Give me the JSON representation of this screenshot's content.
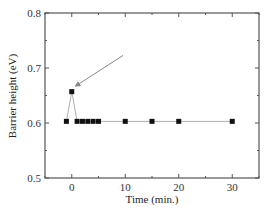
{
  "chart_data": {
    "type": "scatter",
    "title": "",
    "xlabel": "Time (min.)",
    "ylabel": "Barrier height (eV)",
    "xlim": [
      -5,
      35
    ],
    "ylim": [
      0.5,
      0.8
    ],
    "xticks": [
      0,
      10,
      20,
      30
    ],
    "xtick_labels": [
      "0",
      "10",
      "20",
      "30"
    ],
    "yticks": [
      0.5,
      0.6,
      0.7,
      0.8
    ],
    "ytick_labels": [
      "0.5",
      "0.6",
      "0.7",
      "0.8"
    ],
    "grid": false,
    "legend": null,
    "series": [
      {
        "name": "Barrier height",
        "marker": "square",
        "line": "thin gray connecting line",
        "x": [
          -1,
          0,
          1,
          2,
          3,
          4,
          5,
          10,
          15,
          20,
          30
        ],
        "y": [
          0.603,
          0.657,
          0.603,
          0.603,
          0.603,
          0.603,
          0.603,
          0.603,
          0.603,
          0.603,
          0.603
        ]
      }
    ],
    "annotations": [
      {
        "type": "arrow",
        "from": [
          9.6,
          0.723
        ],
        "to": [
          0.7,
          0.667
        ],
        "note": "arrow pointing at peak point (0, 0.657)"
      }
    ]
  },
  "colors": {
    "axis": "#555555",
    "marker": "#111111",
    "line": "#999999",
    "arrow": "#888888"
  }
}
